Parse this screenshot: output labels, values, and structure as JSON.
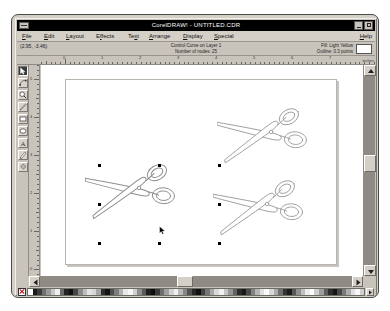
{
  "window": {
    "title": "CorelDRAW! - UNTITLED.CDR",
    "minimize_label": "Minimize",
    "maximize_label": "Maximize",
    "system_menu_label": "System Menu"
  },
  "menu": {
    "items": [
      {
        "label": "File",
        "x": 4
      },
      {
        "label": "Edit",
        "x": 26
      },
      {
        "label": "Layout",
        "x": 48
      },
      {
        "label": "Effects",
        "x": 78
      },
      {
        "label": "Text",
        "x": 110
      },
      {
        "label": "Arrange",
        "x": 131
      },
      {
        "label": "Display",
        "x": 165
      },
      {
        "label": "Special",
        "x": 196
      }
    ],
    "help_label": "Help"
  },
  "status": {
    "coordinates": "(2.95, -3.46)",
    "object_type": "Control Curve on Layer 1",
    "node_count": "Number of nodes:  25",
    "fill": "Fill: Light Yellow",
    "outline": "Outline: 0.3 points",
    "fill_color": "#ffffff"
  },
  "rulers": {
    "units": "inches",
    "horizontal_labels": [
      "0",
      "1",
      "2",
      "3",
      "4",
      "5",
      "6",
      "7",
      "8"
    ],
    "vertical_labels": [
      "5",
      "4",
      "3",
      "2",
      "1",
      "0",
      "1",
      "2",
      "3"
    ]
  },
  "toolbox": {
    "tools": [
      {
        "name": "pick-tool",
        "label": "Pick",
        "selected": true
      },
      {
        "name": "shape-tool",
        "label": "Shape",
        "selected": false
      },
      {
        "name": "zoom-tool",
        "label": "Zoom",
        "selected": false
      },
      {
        "name": "pencil-tool",
        "label": "Pencil",
        "selected": false
      },
      {
        "name": "rectangle-tool",
        "label": "Rectangle",
        "selected": false
      },
      {
        "name": "ellipse-tool",
        "label": "Ellipse",
        "selected": false
      },
      {
        "name": "text-tool",
        "label": "Text",
        "selected": false
      },
      {
        "name": "outline-tool",
        "label": "Outline Pen",
        "selected": false
      },
      {
        "name": "fill-tool",
        "label": "Fill",
        "selected": false
      }
    ]
  },
  "canvas": {
    "page_label": "Drawing Page",
    "objects": [
      {
        "name": "scissors-top-right",
        "label": "Scissors clipart",
        "x": 200,
        "y": 52,
        "w": 96,
        "h": 62,
        "rotation": -14,
        "selected": false
      },
      {
        "name": "scissors-selected",
        "label": "Scissors clipart",
        "x": 68,
        "y": 108,
        "w": 96,
        "h": 62,
        "rotation": -14,
        "selected": true
      },
      {
        "name": "scissors-bottom-right",
        "label": "Scissors clipart",
        "x": 196,
        "y": 124,
        "w": 96,
        "h": 62,
        "rotation": -14,
        "selected": false
      }
    ],
    "selection": {
      "x": 58,
      "y": 100,
      "w": 120,
      "h": 78
    },
    "cursor": {
      "x": 116,
      "y": 164
    }
  },
  "scrollbars": {
    "vertical": {
      "thumb_top_pct": 42,
      "thumb_size_pct": 9
    },
    "horizontal": {
      "thumb_left_pct": 44,
      "thumb_size_pct": 5
    }
  },
  "palette": {
    "no_fill_label": "No Fill",
    "more_label": "More colors",
    "colors": [
      "#ffffff",
      "#1a1a1a",
      "#3c3c3c",
      "#707070",
      "#9a9a9a",
      "#c8c8c8",
      "#efefef",
      "#6b6b6b",
      "#232323",
      "#111111",
      "#454545",
      "#8a8a8a",
      "#bdbdbd",
      "#e4e4e4",
      "#d6d6d6",
      "#a5a5a5",
      "#2e2e2e",
      "#141414",
      "#4f4f4f",
      "#7d7d7d",
      "#b0b0b0",
      "#e8e8e8",
      "#f6f6f6",
      "#cfcfcf",
      "#8f8f8f",
      "#5a5a5a",
      "#1f1f1f",
      "#0d0d0d",
      "#3a3a3a",
      "#6e6e6e",
      "#a0a0a0",
      "#d2d2d2",
      "#f0f0f0",
      "#bababa",
      "#868686",
      "#525252",
      "#262626",
      "#101010",
      "#434343",
      "#757575",
      "#a8a8a8",
      "#dadada",
      "#f2f2f2",
      "#c4c4c4",
      "#969696",
      "#626262",
      "#2a2a2a",
      "#181818",
      "#4b4b4b",
      "#838383",
      "#b5b5b5",
      "#e0e0e0",
      "#fafafa",
      "#d8d8d8",
      "#ababab",
      "#6f6f6f",
      "#333333",
      "#1c1c1c",
      "#575757",
      "#909090",
      "#c0c0c0",
      "#ececec",
      "#ffffff",
      "#cdcdcd",
      "#9e9e9e",
      "#5e5e5e",
      "#2c2c2c",
      "#151515",
      "#484848",
      "#7a7a7a",
      "#adadad",
      "#dfdfdf",
      "#f8f8f8",
      "#d0d0d0"
    ]
  }
}
